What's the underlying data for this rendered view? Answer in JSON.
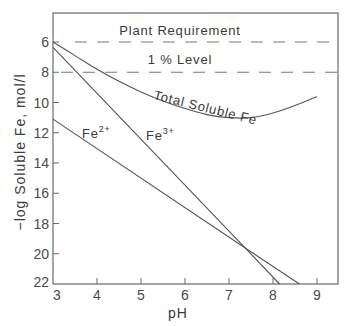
{
  "chart_data": {
    "type": "line",
    "title": "",
    "xlabel": "pH",
    "ylabel": "−log Soluble  Fe, mol/l",
    "xlim": [
      3,
      9.5
    ],
    "ylim": [
      4,
      22
    ],
    "y_inverted": true,
    "x_ticks": [
      3,
      4,
      5,
      6,
      7,
      8,
      9
    ],
    "x_tick_labels": [
      "3",
      "4",
      "5",
      "6",
      "7",
      "8",
      "9"
    ],
    "y_ticks": [
      6,
      8,
      10,
      12,
      14,
      16,
      18,
      20,
      22
    ],
    "y_tick_labels": [
      "6",
      "8",
      "10",
      "12",
      "14",
      "16",
      "18",
      "20",
      "22"
    ],
    "grid": false,
    "reference_lines": [
      {
        "name": "Plant Requirement",
        "label": "Plant  Requirement",
        "y": 6,
        "style": "dashed"
      },
      {
        "name": "1% Level",
        "label": "1 % Level",
        "y": 8,
        "style": "dashed"
      }
    ],
    "series": [
      {
        "name": "Total Soluble Fe",
        "label": "Total  Soluble  Fe",
        "x": [
          3.0,
          3.5,
          4.0,
          4.5,
          5.0,
          5.5,
          6.0,
          6.5,
          7.0,
          7.5,
          8.0,
          8.5,
          9.0
        ],
        "y": [
          6.0,
          6.9,
          7.8,
          8.6,
          9.3,
          9.9,
          10.4,
          10.8,
          11.0,
          11.0,
          10.7,
          10.2,
          9.6
        ]
      },
      {
        "name": "Fe3+",
        "label_base": "Fe",
        "label_sup": "3+",
        "x": [
          3.0,
          7.36,
          8.15
        ],
        "y": [
          6.35,
          19.6,
          22.0
        ]
      },
      {
        "name": "Fe2+",
        "label_base": "Fe",
        "label_sup": "2+",
        "x": [
          3.0,
          7.36,
          8.6
        ],
        "y": [
          11.1,
          19.6,
          22.0
        ]
      }
    ]
  }
}
